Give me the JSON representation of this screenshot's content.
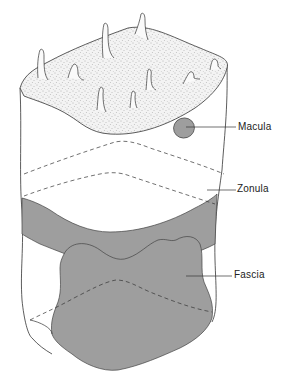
{
  "figure": {
    "colors": {
      "outline": "#333333",
      "junction_fill": "#9e9e9e",
      "surface_stipple": "#7a7a7a",
      "background": "#ffffff"
    },
    "labels": {
      "macula": "Macula",
      "zonula": "Zonula",
      "fascia": "Fascia"
    }
  }
}
